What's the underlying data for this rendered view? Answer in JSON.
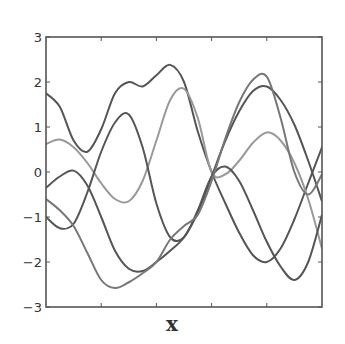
{
  "chart_data": {
    "type": "line",
    "title": "",
    "xlabel": "x",
    "ylabel": "",
    "xlim": [
      0,
      10
    ],
    "ylim": [
      -3,
      3
    ],
    "grid": false,
    "legend": null,
    "x_ticks": [
      2,
      4,
      6,
      8
    ],
    "x_tick_labels": [],
    "y_ticks": [
      3,
      2,
      1,
      0,
      -1,
      -2,
      -3
    ],
    "y_tick_labels": [
      "3",
      "2",
      "1",
      "0",
      "−1",
      "−2",
      "−3"
    ],
    "series": [
      {
        "name": "sample-1",
        "color": "#555555",
        "x": [
          0,
          0.5,
          1.0,
          1.5,
          2.0,
          2.5,
          3.0,
          3.5,
          4.0,
          4.5,
          5.0,
          5.5,
          6.0,
          6.5,
          7.0,
          7.5,
          8.0,
          8.5,
          9.0,
          9.5,
          10.0
        ],
        "y": [
          1.75,
          1.45,
          0.7,
          0.45,
          0.95,
          1.75,
          2.0,
          1.9,
          2.15,
          2.38,
          2.0,
          0.9,
          0.0,
          -0.7,
          -1.35,
          -1.85,
          -2.0,
          -1.7,
          -1.05,
          -0.25,
          0.55
        ]
      },
      {
        "name": "sample-2",
        "color": "#999999",
        "x": [
          0,
          0.5,
          1.0,
          1.5,
          2.0,
          2.5,
          3.0,
          3.5,
          4.0,
          4.5,
          5.0,
          5.5,
          6.0,
          6.5,
          7.0,
          7.5,
          8.0,
          8.5,
          9.0,
          9.5,
          10.0
        ],
        "y": [
          0.62,
          0.72,
          0.55,
          0.2,
          -0.25,
          -0.6,
          -0.65,
          -0.2,
          0.7,
          1.6,
          1.85,
          1.2,
          0.0,
          -0.05,
          0.25,
          0.65,
          0.88,
          0.7,
          0.2,
          -0.6,
          -1.7
        ]
      },
      {
        "name": "sample-3",
        "color": "#555555",
        "x": [
          0,
          0.5,
          1.0,
          1.5,
          2.0,
          2.5,
          3.0,
          3.5,
          4.0,
          4.5,
          5.0,
          5.5,
          6.0,
          6.5,
          7.0,
          7.5,
          8.0,
          8.5,
          9.0,
          9.5,
          10.0
        ],
        "y": [
          -0.35,
          -0.1,
          0.03,
          -0.3,
          -1.0,
          -1.75,
          -2.15,
          -2.2,
          -2.0,
          -1.75,
          -1.45,
          -0.9,
          -0.1,
          0.7,
          1.35,
          1.8,
          1.9,
          1.6,
          1.05,
          0.25,
          -0.65
        ]
      },
      {
        "name": "sample-4",
        "color": "#555555",
        "x": [
          0,
          0.5,
          1.0,
          1.5,
          2.0,
          2.5,
          3.0,
          3.5,
          4.0,
          4.5,
          5.0,
          5.5,
          6.0,
          6.5,
          7.0,
          7.5,
          8.0,
          8.5,
          9.0,
          9.5,
          10.0
        ],
        "y": [
          -1.0,
          -1.25,
          -1.15,
          -0.45,
          0.45,
          1.1,
          1.28,
          0.55,
          -0.7,
          -1.45,
          -1.45,
          -0.85,
          -0.1,
          0.12,
          -0.2,
          -0.85,
          -1.55,
          -2.1,
          -2.4,
          -2.0,
          -0.95
        ]
      },
      {
        "name": "sample-5",
        "color": "#777777",
        "x": [
          0,
          0.5,
          1.0,
          1.5,
          2.0,
          2.5,
          3.0,
          3.5,
          4.0,
          4.5,
          5.0,
          5.5,
          6.0,
          6.5,
          7.0,
          7.5,
          8.0,
          8.5,
          9.0,
          9.5,
          10.0
        ],
        "y": [
          -0.6,
          -0.85,
          -1.2,
          -1.8,
          -2.4,
          -2.58,
          -2.45,
          -2.25,
          -2.0,
          -1.5,
          -1.2,
          -0.95,
          -0.2,
          0.75,
          1.55,
          2.05,
          2.12,
          1.2,
          0.0,
          -0.5,
          -0.05
        ]
      }
    ]
  }
}
